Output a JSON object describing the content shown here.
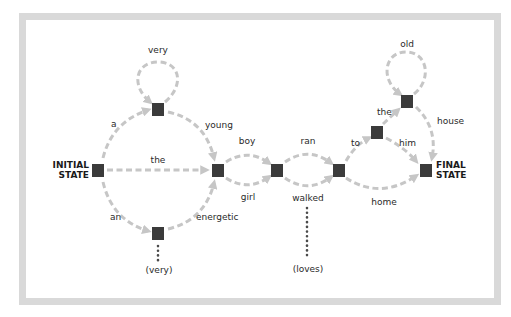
{
  "diagram": {
    "type": "finite-state-automaton",
    "colors": {
      "frame": "#d9d9d9",
      "node": "#3b3b3b",
      "edge": "#c6c6c6",
      "text": "#2a2a2a"
    },
    "states": {
      "initial": {
        "line1": "INITIAL",
        "line2": "STATE"
      },
      "final": {
        "line1": "FINAL",
        "line2": "STATE"
      }
    },
    "nodes": [
      {
        "id": "initial",
        "x": 98,
        "y": 170
      },
      {
        "id": "adj_loop",
        "x": 158,
        "y": 109
      },
      {
        "id": "an_node",
        "x": 158,
        "y": 233
      },
      {
        "id": "noun_node",
        "x": 218,
        "y": 170
      },
      {
        "id": "verb_node",
        "x": 277,
        "y": 170
      },
      {
        "id": "prep_node",
        "x": 339,
        "y": 170
      },
      {
        "id": "to_node",
        "x": 377,
        "y": 132
      },
      {
        "id": "the_node",
        "x": 407,
        "y": 101
      },
      {
        "id": "final",
        "x": 426,
        "y": 170
      }
    ],
    "edges": [
      {
        "from": "initial",
        "to": "adj_loop",
        "label": "a"
      },
      {
        "from": "adj_loop",
        "to": "adj_loop",
        "label": "very"
      },
      {
        "from": "adj_loop",
        "to": "noun_node",
        "label": "young"
      },
      {
        "from": "initial",
        "to": "noun_node",
        "label": "the"
      },
      {
        "from": "initial",
        "to": "an_node",
        "label": "an"
      },
      {
        "from": "an_node",
        "to": "noun_node",
        "label": "energetic"
      },
      {
        "from": "noun_node",
        "to": "verb_node",
        "label": "boy"
      },
      {
        "from": "noun_node",
        "to": "verb_node",
        "label": "girl"
      },
      {
        "from": "verb_node",
        "to": "prep_node",
        "label": "ran"
      },
      {
        "from": "verb_node",
        "to": "prep_node",
        "label": "walked"
      },
      {
        "from": "prep_node",
        "to": "to_node",
        "label": "to"
      },
      {
        "from": "to_node",
        "to": "the_node",
        "label": "the"
      },
      {
        "from": "the_node",
        "to": "the_node",
        "label": "old"
      },
      {
        "from": "the_node",
        "to": "final",
        "label": "house"
      },
      {
        "from": "to_node",
        "to": "final",
        "label": "him"
      },
      {
        "from": "prep_node",
        "to": "final",
        "label": "home"
      }
    ],
    "ellipses": [
      {
        "attached_to": "an_node",
        "label": "(very)"
      },
      {
        "attached_to": "walked",
        "label": "(loves)"
      }
    ]
  }
}
